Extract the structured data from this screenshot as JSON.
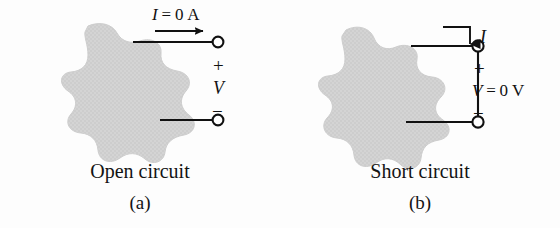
{
  "figure": {
    "background_color": "#fdfdfd",
    "blob_fill_color": "#d4d4d4",
    "line_color": "#111111",
    "terminal_fill_color": "#ffffff"
  },
  "panels": [
    {
      "id": "a",
      "caption_main": "Open circuit",
      "caption_sub": "(a)",
      "blob_name": "network-blob",
      "current": {
        "variable": "I",
        "equals": "=",
        "value": "0",
        "unit": "A",
        "full_text": "I = 0 A",
        "arrow_direction": "right",
        "arrow_name": "current-arrow-right"
      },
      "voltage": {
        "variable": "V",
        "full_text": "V",
        "plus_sign": "+",
        "minus_sign": "−"
      },
      "terminals": [
        {
          "name": "terminal-top",
          "polarity": "+"
        },
        {
          "name": "terminal-bottom",
          "polarity": "−"
        }
      ],
      "connection": "open"
    },
    {
      "id": "b",
      "caption_main": "Short circuit",
      "caption_sub": "(b)",
      "blob_name": "network-blob",
      "current": {
        "variable": "I",
        "full_text": "I",
        "arrow_direction": "down",
        "arrow_name": "current-arrow-down"
      },
      "voltage": {
        "variable": "V",
        "equals": "=",
        "value": "0",
        "unit": "V",
        "full_text": "V = 0 V",
        "plus_sign": "+",
        "minus_sign": "−"
      },
      "terminals": [
        {
          "name": "terminal-top",
          "polarity": "+"
        },
        {
          "name": "terminal-bottom",
          "polarity": "−"
        }
      ],
      "connection": "shorted"
    }
  ]
}
